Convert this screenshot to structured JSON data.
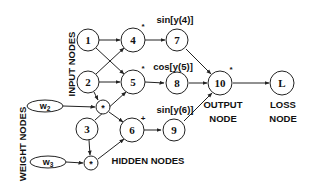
{
  "diagram": {
    "group_labels": {
      "input": "INPUT NODES",
      "weight": "WEIGHT NODES",
      "hidden": "HIDDEN NODES",
      "output_line1": "OUTPUT",
      "output_line2": "NODE",
      "loss_line1": "LOSS",
      "loss_line2": "NODE"
    },
    "nodes": {
      "n1": "1",
      "n2": "2",
      "n3": "3",
      "n4": "4",
      "n5": "5",
      "n6": "6",
      "n7": "7",
      "n8": "8",
      "n9": "9",
      "n10": "10",
      "loss": "L",
      "mult_top": "*",
      "mult_bottom": "*"
    },
    "weights": {
      "w2_base": "w",
      "w2_sub": "2",
      "w3_base": "w",
      "w3_sub": "3"
    },
    "function_labels": {
      "f7": "sin[y(4)]",
      "f8": "cos[y(5)]",
      "f9": "sin[y(6)]"
    },
    "operation_marks": {
      "op4": "*",
      "op5": "*",
      "op6": "+",
      "op10": "*"
    },
    "edges": [
      {
        "from": "1",
        "to": "4"
      },
      {
        "from": "1",
        "to": "5"
      },
      {
        "from": "2",
        "to": "4"
      },
      {
        "from": "2",
        "to": "5"
      },
      {
        "from": "2",
        "to": "mult_top"
      },
      {
        "from": "w2",
        "to": "mult_top"
      },
      {
        "from": "mult_top",
        "to": "6"
      },
      {
        "from": "3",
        "to": "5"
      },
      {
        "from": "3",
        "to": "mult_bottom"
      },
      {
        "from": "w3",
        "to": "mult_bottom"
      },
      {
        "from": "mult_bottom",
        "to": "6"
      },
      {
        "from": "4",
        "to": "7"
      },
      {
        "from": "5",
        "to": "8"
      },
      {
        "from": "6",
        "to": "9"
      },
      {
        "from": "7",
        "to": "10"
      },
      {
        "from": "8",
        "to": "10"
      },
      {
        "from": "9",
        "to": "10"
      },
      {
        "from": "10",
        "to": "L"
      }
    ]
  }
}
